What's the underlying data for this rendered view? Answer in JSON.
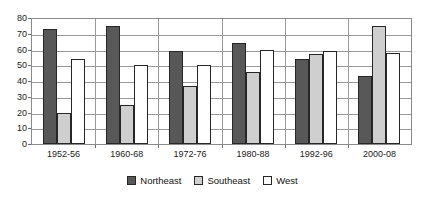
{
  "chart_data": {
    "type": "bar",
    "title": "",
    "xlabel": "",
    "ylabel": "",
    "ylim": [
      0,
      80
    ],
    "ytick_step": 10,
    "yticks": [
      "80",
      "70",
      "60",
      "50",
      "40",
      "30",
      "20",
      "10",
      "0"
    ],
    "grid": true,
    "legend_position": "bottom",
    "categories": [
      "1952-56",
      "1960-68",
      "1972-76",
      "1980-88",
      "1992-96",
      "2000-08"
    ],
    "series": [
      {
        "name": "Northeast",
        "color": "#585858",
        "values": [
          73,
          75,
          59,
          64,
          54,
          43
        ]
      },
      {
        "name": "Southeast",
        "color": "#cfcfcf",
        "values": [
          20,
          25,
          37,
          46,
          57,
          75
        ]
      },
      {
        "name": "West",
        "color": "#ffffff",
        "values": [
          54,
          50,
          50,
          60,
          59,
          58
        ]
      }
    ]
  },
  "legend": {
    "items": [
      {
        "label": "Northeast",
        "swatch": "northeast"
      },
      {
        "label": "Southeast",
        "swatch": "southeast"
      },
      {
        "label": "West",
        "swatch": "west"
      }
    ]
  }
}
